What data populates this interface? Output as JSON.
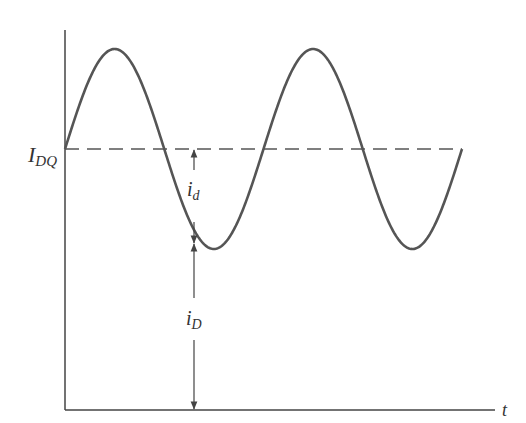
{
  "figure": {
    "labels": {
      "quiescent": "I",
      "quiescent_sub": "DQ",
      "small_signal": "i",
      "small_signal_sub": "d",
      "total": "i",
      "total_sub": "D",
      "time_axis": "t"
    },
    "colors": {
      "curve": "#555555",
      "axes": "#444444",
      "dashed": "#555555",
      "background": "#ffffff"
    }
  },
  "chart_data": {
    "type": "line",
    "title": "",
    "xlabel": "t",
    "ylabel": "",
    "series": [
      {
        "name": "i_D (sinusoid about I_DQ)",
        "shape": "sine",
        "cycles": 2,
        "starts_at": "I_DQ",
        "amplitude_relative": 1
      }
    ],
    "reference_lines": [
      {
        "name": "I_DQ",
        "style": "dashed",
        "level": "quiescent"
      }
    ],
    "annotations": [
      "i_d (I_DQ to trough)",
      "i_D (axis to trough)"
    ]
  }
}
